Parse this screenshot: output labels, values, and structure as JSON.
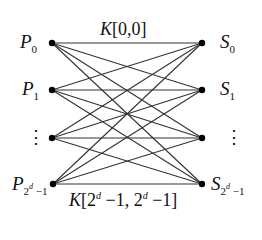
{
  "diagram": {
    "type": "complete-bipartite-graph",
    "colors": {
      "edge": "#333333",
      "node": "#000000",
      "background": "#ffffff"
    },
    "left_nodes": [
      {
        "id": "P0",
        "label_base": "P",
        "label_sub": "0",
        "x": 52,
        "y": 43
      },
      {
        "id": "P1",
        "label_base": "P",
        "label_sub": "1",
        "x": 52,
        "y": 90
      },
      {
        "id": "Pdots",
        "label_base": "⋮",
        "label_sub": "",
        "x": 52,
        "y": 138
      },
      {
        "id": "Plast",
        "label_base": "P",
        "label_sub": "2^d −1",
        "x": 53,
        "y": 184
      }
    ],
    "right_nodes": [
      {
        "id": "S0",
        "label_base": "S",
        "label_sub": "0",
        "x": 202,
        "y": 43
      },
      {
        "id": "S1",
        "label_base": "S",
        "label_sub": "1",
        "x": 202,
        "y": 90
      },
      {
        "id": "Sdots",
        "label_base": "⋮",
        "label_sub": "",
        "x": 202,
        "y": 138
      },
      {
        "id": "Slast",
        "label_base": "S",
        "label_sub": "2^d −1",
        "x": 202,
        "y": 184
      }
    ],
    "edge_labels": {
      "top": {
        "text": "K[0,0]",
        "k": "K",
        "args": "[0,0]"
      },
      "bottom": {
        "text": "K[2^d −1, 2^d −1]",
        "k": "K",
        "open": "[2",
        "sup1": "d",
        "mid": " −1, 2",
        "sup2": "d",
        "close": " −1]"
      }
    },
    "labels": {
      "p0_base": "P",
      "p0_sub": "0",
      "p1_base": "P",
      "p1_sub": "1",
      "plast_base": "P",
      "plast_sub_pre": "2",
      "plast_sub_sup": "d",
      "plast_sub_post": " −1",
      "s0_base": "S",
      "s0_sub": "0",
      "s1_base": "S",
      "s1_sub": "1",
      "slast_base": "S",
      "slast_sub_pre": "2",
      "slast_sub_sup": "d",
      "slast_sub_post": " −1",
      "vdots": "⋮"
    }
  }
}
